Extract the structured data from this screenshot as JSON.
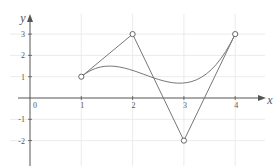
{
  "chart_data": {
    "type": "line",
    "title": "",
    "xlabel": "x",
    "ylabel": "y",
    "origin_label": "0",
    "x_ticks": [
      "1",
      "2",
      "3",
      "4"
    ],
    "y_ticks": [
      "3",
      "2",
      "1",
      "-1",
      "-2"
    ],
    "xlim": [
      0,
      4.5
    ],
    "ylim": [
      -2.8,
      3.8
    ],
    "grid": true,
    "series": [
      {
        "name": "control polygon",
        "x": [
          1,
          2,
          3,
          4
        ],
        "y": [
          1,
          3,
          -2,
          3
        ],
        "markers": "open-circle"
      },
      {
        "name": "bezier curve",
        "kind": "cubic-bezier",
        "control_points": [
          [
            1,
            1
          ],
          [
            2,
            3
          ],
          [
            3,
            -2
          ],
          [
            4,
            3
          ]
        ]
      }
    ],
    "colors": {
      "axis": "#555555",
      "grid": "#e6e6e6",
      "line": "#777777"
    }
  }
}
